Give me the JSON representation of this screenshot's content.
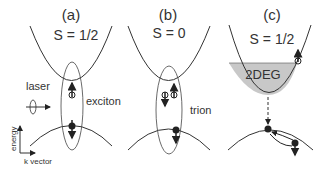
{
  "panels": [
    {
      "id": "a",
      "title": "(a)",
      "spin": "S = 1/2",
      "label": "exciton"
    },
    {
      "id": "b",
      "title": "(b)",
      "spin": "S = 0",
      "label": "trion"
    },
    {
      "id": "c",
      "title": "(c)",
      "spin": "S = 1/2",
      "label": "2DEG"
    }
  ],
  "laser_label": "laser",
  "axes": {
    "y": "energy",
    "x": "k vector"
  },
  "colors": {
    "line": "#333333",
    "fill_2deg": "#c8c8c8"
  }
}
